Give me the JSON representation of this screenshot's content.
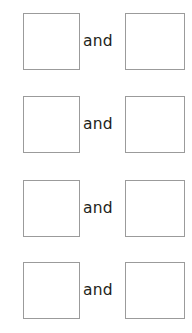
{
  "page": {
    "background_color": "#ffffff",
    "width": 192,
    "height": 333
  },
  "style": {
    "box_border_color": "#9b9b9b",
    "box_fill_color": "#ffffff",
    "text_color": "#231f20"
  },
  "worksheet": {
    "rows": [
      {
        "left_box_value": "",
        "conjunction": "and",
        "right_box_value": "",
        "top": 13
      },
      {
        "left_box_value": "",
        "conjunction": "and",
        "right_box_value": "",
        "top": 96
      },
      {
        "left_box_value": "",
        "conjunction": "and",
        "right_box_value": "",
        "top": 180
      },
      {
        "left_box_value": "",
        "conjunction": "and",
        "right_box_value": "",
        "top": 262
      }
    ]
  }
}
